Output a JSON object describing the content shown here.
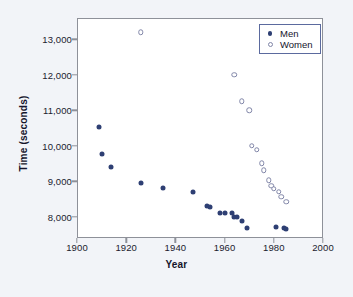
{
  "chart_data": {
    "type": "scatter",
    "title": "",
    "xlabel": "Year",
    "ylabel": "Time (seconds)",
    "xlim": [
      1900,
      2000
    ],
    "ylim": [
      7400,
      13600
    ],
    "xticks": [
      1900,
      1920,
      1940,
      1960,
      1980,
      2000
    ],
    "xtick_labels": [
      "1900",
      "1920",
      "1940",
      "1960",
      "1980",
      "2000"
    ],
    "yticks": [
      8000,
      9000,
      10000,
      11000,
      12000,
      13000
    ],
    "ytick_labels": [
      "8,000",
      "9,000",
      "10,000",
      "11,000",
      "12,000",
      "13,000"
    ],
    "grid": false,
    "legend_position": "top-right",
    "colors": {
      "men": "#2e3f73",
      "women_edge": "#8186a8",
      "women_fill": "#ffffff",
      "frame": "#8e9199",
      "background": "#f2f4f8",
      "plot_background": "#ffffff",
      "legend_border": "#5b6a9e"
    },
    "series": [
      {
        "name": "Men",
        "marker": "filled-circle",
        "points": [
          {
            "x": 1909,
            "y": 10530
          },
          {
            "x": 1910,
            "y": 9760
          },
          {
            "x": 1914,
            "y": 9400
          },
          {
            "x": 1926,
            "y": 8950
          },
          {
            "x": 1935,
            "y": 8820
          },
          {
            "x": 1947,
            "y": 8710
          },
          {
            "x": 1953,
            "y": 8300
          },
          {
            "x": 1954,
            "y": 8260
          },
          {
            "x": 1958,
            "y": 8110
          },
          {
            "x": 1960,
            "y": 8110
          },
          {
            "x": 1963,
            "y": 8100
          },
          {
            "x": 1964,
            "y": 7990
          },
          {
            "x": 1965,
            "y": 7980
          },
          {
            "x": 1967,
            "y": 7870
          },
          {
            "x": 1969,
            "y": 7690
          },
          {
            "x": 1981,
            "y": 7700
          },
          {
            "x": 1984,
            "y": 7690
          },
          {
            "x": 1985,
            "y": 7640
          }
        ]
      },
      {
        "name": "Women",
        "marker": "open-circle",
        "points": [
          {
            "x": 1926,
            "y": 13200
          },
          {
            "x": 1964,
            "y": 12000
          },
          {
            "x": 1967,
            "y": 11250
          },
          {
            "x": 1970,
            "y": 11000
          },
          {
            "x": 1971,
            "y": 10000
          },
          {
            "x": 1973,
            "y": 9890
          },
          {
            "x": 1975,
            "y": 9500
          },
          {
            "x": 1976,
            "y": 9310
          },
          {
            "x": 1978,
            "y": 9030
          },
          {
            "x": 1979,
            "y": 8870
          },
          {
            "x": 1980,
            "y": 8790
          },
          {
            "x": 1982,
            "y": 8710
          },
          {
            "x": 1983,
            "y": 8560
          },
          {
            "x": 1985,
            "y": 8420
          }
        ]
      }
    ]
  },
  "legend": {
    "entries": [
      {
        "label": "Men",
        "marker": "filled-circle"
      },
      {
        "label": "Women",
        "marker": "open-circle"
      }
    ]
  }
}
